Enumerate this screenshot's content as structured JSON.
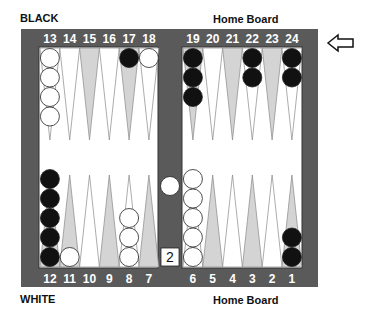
{
  "labels": {
    "top_left": "BLACK",
    "top_right": "Home Board",
    "bottom_left": "WHITE",
    "bottom_right": "Home Board"
  },
  "colors": {
    "frame": "#5a5a5a",
    "light_point": "#ffffff",
    "shaded_point": "#d4d4d4",
    "black_checker": "#111111",
    "white_checker": "#ffffff"
  },
  "top_points": [
    {
      "number": "13",
      "shade": "light",
      "checkers": {
        "color": "white",
        "count": 4
      }
    },
    {
      "number": "14",
      "shade": "light",
      "checkers": null
    },
    {
      "number": "15",
      "shade": "shaded",
      "checkers": null
    },
    {
      "number": "16",
      "shade": "light",
      "checkers": null
    },
    {
      "number": "17",
      "shade": "shaded",
      "checkers": {
        "color": "black",
        "count": 1
      }
    },
    {
      "number": "18",
      "shade": "light",
      "checkers": {
        "color": "white",
        "count": 1
      }
    },
    {
      "number": "19",
      "shade": "shaded",
      "checkers": {
        "color": "black",
        "count": 3
      }
    },
    {
      "number": "20",
      "shade": "light",
      "checkers": null
    },
    {
      "number": "21",
      "shade": "shaded",
      "checkers": null
    },
    {
      "number": "22",
      "shade": "light",
      "checkers": {
        "color": "black",
        "count": 2
      }
    },
    {
      "number": "23",
      "shade": "shaded",
      "checkers": null
    },
    {
      "number": "24",
      "shade": "light",
      "checkers": {
        "color": "black",
        "count": 2
      }
    }
  ],
  "bottom_points": [
    {
      "number": "12",
      "shade": "shaded",
      "checkers": {
        "color": "black",
        "count": 5
      }
    },
    {
      "number": "11",
      "shade": "shaded",
      "checkers": {
        "color": "white",
        "count": 1
      }
    },
    {
      "number": "10",
      "shade": "light",
      "checkers": null
    },
    {
      "number": "9",
      "shade": "shaded",
      "checkers": null
    },
    {
      "number": "8",
      "shade": "light",
      "checkers": {
        "color": "white",
        "count": 3
      }
    },
    {
      "number": "7",
      "shade": "shaded",
      "checkers": null
    },
    {
      "number": "6",
      "shade": "light",
      "checkers": {
        "color": "white",
        "count": 5
      }
    },
    {
      "number": "5",
      "shade": "shaded",
      "checkers": null
    },
    {
      "number": "4",
      "shade": "light",
      "checkers": null
    },
    {
      "number": "3",
      "shade": "shaded",
      "checkers": null
    },
    {
      "number": "2",
      "shade": "light",
      "checkers": null
    },
    {
      "number": "1",
      "shade": "shaded",
      "checkers": {
        "color": "black",
        "count": 2
      }
    }
  ],
  "bar": {
    "white_checkers": 1,
    "black_checkers": 0
  },
  "doubling_cube": {
    "value": "2"
  },
  "turn_indicator": "arrow-left-icon"
}
